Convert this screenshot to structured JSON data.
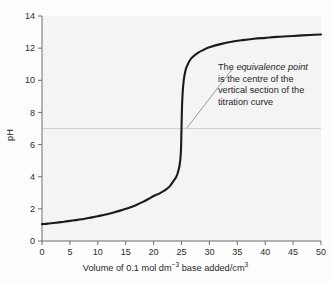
{
  "figure": {
    "name": "acid-base-titration-curve",
    "background_color": "#fdfdfd",
    "plot_background_color": "#f4f4f4",
    "curve_color": "#1a1a1a",
    "axis_color": "#6f6f6f",
    "gridline_color": "#cfcfcf",
    "leader_color": "#9a9a9a"
  },
  "annotation": {
    "line1_prefix": "The ",
    "emphasis": "equivalence point",
    "line2": "is the centre of the",
    "line3": "vertical section of the",
    "line4": "titration curve",
    "full_text": "The equivalence point is the centre of the vertical section of the titration curve"
  },
  "axis_titles": {
    "x_prefix": "Volume of 0.1 mol dm",
    "x_sup1": "−3",
    "x_middle": " base added/cm",
    "x_sup2": "3",
    "x_full": "Volume of 0.1 mol dm−3 base added/cm3",
    "y": "pH"
  },
  "chart_data": {
    "type": "line",
    "title": "",
    "xlabel": "Volume of 0.1 mol dm-3 base added/cm3",
    "ylabel": "pH",
    "xlim": [
      0,
      50
    ],
    "ylim": [
      0,
      14
    ],
    "xticks": [
      0,
      5,
      10,
      15,
      20,
      25,
      30,
      35,
      40,
      45,
      50
    ],
    "yticks": [
      0,
      2,
      4,
      6,
      8,
      10,
      12,
      14
    ],
    "xtick_labels": [
      "0",
      "5",
      "10",
      "15",
      "20",
      "25",
      "30",
      "35",
      "40",
      "45",
      "50"
    ],
    "ytick_labels": [
      "0",
      "2",
      "4",
      "6",
      "8",
      "10",
      "12",
      "14"
    ],
    "grid": "horizontal-single",
    "gridlines_y": [
      7
    ],
    "legend": "none",
    "equivalence_point": {
      "x": 25,
      "y": 7
    },
    "series": [
      {
        "name": "titration curve",
        "x": [
          0,
          1,
          2,
          3,
          4,
          5,
          6,
          7,
          8,
          9,
          10,
          11,
          12,
          13,
          14,
          15,
          16,
          17,
          18,
          19,
          20,
          21,
          22,
          22.5,
          23,
          23.5,
          24,
          24.3,
          24.6,
          24.8,
          24.9,
          24.95,
          25,
          25.05,
          25.1,
          25.2,
          25.4,
          25.7,
          26,
          26.5,
          27,
          28,
          29,
          30,
          32,
          34,
          36,
          38,
          40,
          42,
          44,
          46,
          48,
          50
        ],
        "y": [
          1.05,
          1.08,
          1.12,
          1.16,
          1.2,
          1.25,
          1.3,
          1.35,
          1.41,
          1.47,
          1.54,
          1.62,
          1.7,
          1.79,
          1.89,
          2.0,
          2.12,
          2.26,
          2.42,
          2.6,
          2.8,
          2.95,
          3.15,
          3.28,
          3.45,
          3.7,
          3.95,
          4.2,
          4.6,
          5.1,
          5.6,
          6.2,
          7.0,
          7.8,
          8.4,
          9.2,
          10.0,
          10.6,
          10.9,
          11.25,
          11.45,
          11.72,
          11.9,
          12.05,
          12.25,
          12.4,
          12.5,
          12.58,
          12.64,
          12.7,
          12.74,
          12.78,
          12.82,
          12.85
        ]
      }
    ]
  }
}
